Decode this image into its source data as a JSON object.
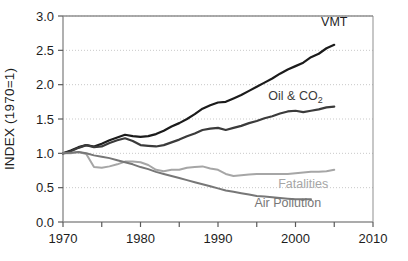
{
  "chart_data": {
    "type": "line",
    "title": "",
    "xlabel": "",
    "ylabel": "INDEX (1970=1)",
    "xlim": [
      1970,
      2010
    ],
    "ylim": [
      0.0,
      3.0
    ],
    "grid": "horizontal-dotted",
    "legend_position": "inline-right",
    "x_ticks": [
      1970,
      1975,
      1980,
      1985,
      1990,
      1995,
      2000,
      2005,
      2010
    ],
    "x_tick_labels": [
      "1970",
      "",
      "1980",
      "",
      "1990",
      "",
      "2000",
      "",
      "2010"
    ],
    "x_tick_labels_visible": [
      "1970",
      "1980",
      "1990",
      "2000",
      "2010"
    ],
    "y_ticks": [
      0.0,
      0.5,
      1.0,
      1.5,
      2.0,
      2.5,
      3.0
    ],
    "y_tick_labels": [
      "0.0",
      "0.5",
      "1.0",
      "1.5",
      "2.0",
      "2.5",
      "3.0"
    ],
    "series": [
      {
        "name": "VMT",
        "label": "VMT",
        "color": "#1b1b1b",
        "width": 2.2,
        "label_x": 2005,
        "label_y": 2.86,
        "x": [
          1970,
          1971,
          1972,
          1973,
          1974,
          1975,
          1976,
          1977,
          1978,
          1979,
          1980,
          1981,
          1982,
          1983,
          1984,
          1985,
          1986,
          1987,
          1988,
          1989,
          1990,
          1991,
          1992,
          1993,
          1994,
          1995,
          1996,
          1997,
          1998,
          1999,
          2000,
          2001,
          2002,
          2003,
          2004,
          2005
        ],
        "values": [
          1.0,
          1.04,
          1.09,
          1.12,
          1.1,
          1.14,
          1.19,
          1.23,
          1.27,
          1.25,
          1.24,
          1.25,
          1.28,
          1.33,
          1.39,
          1.44,
          1.5,
          1.57,
          1.65,
          1.7,
          1.74,
          1.75,
          1.8,
          1.85,
          1.91,
          1.97,
          2.03,
          2.09,
          2.16,
          2.22,
          2.27,
          2.32,
          2.4,
          2.45,
          2.53,
          2.58
        ]
      },
      {
        "name": "Oil & CO2",
        "label": "Oil & CO",
        "label_sub": "2",
        "color": "#3b3b3b",
        "width": 2.2,
        "label_x": 2000,
        "label_y": 1.78,
        "x": [
          1970,
          1971,
          1972,
          1973,
          1974,
          1975,
          1976,
          1977,
          1978,
          1979,
          1980,
          1981,
          1982,
          1983,
          1984,
          1985,
          1986,
          1987,
          1988,
          1989,
          1990,
          1991,
          1992,
          1993,
          1994,
          1995,
          1996,
          1997,
          1998,
          1999,
          2000,
          2001,
          2002,
          2003,
          2004,
          2005
        ],
        "values": [
          1.0,
          1.03,
          1.08,
          1.12,
          1.09,
          1.1,
          1.15,
          1.19,
          1.22,
          1.18,
          1.12,
          1.11,
          1.1,
          1.12,
          1.16,
          1.2,
          1.25,
          1.29,
          1.34,
          1.36,
          1.37,
          1.34,
          1.37,
          1.4,
          1.44,
          1.47,
          1.51,
          1.54,
          1.58,
          1.61,
          1.62,
          1.6,
          1.62,
          1.64,
          1.67,
          1.68
        ]
      },
      {
        "name": "Fatalities",
        "label": "Fatalities",
        "color": "#a6a6a6",
        "width": 2.0,
        "label_x": 2001,
        "label_y": 0.5,
        "x": [
          1970,
          1971,
          1972,
          1973,
          1974,
          1975,
          1976,
          1977,
          1978,
          1979,
          1980,
          1981,
          1982,
          1983,
          1984,
          1985,
          1986,
          1987,
          1988,
          1989,
          1990,
          1991,
          1992,
          1993,
          1994,
          1995,
          1996,
          1997,
          1998,
          1999,
          2000,
          2001,
          2002,
          2003,
          2004,
          2005
        ],
        "values": [
          1.0,
          1.0,
          1.02,
          0.99,
          0.8,
          0.79,
          0.81,
          0.84,
          0.88,
          0.88,
          0.87,
          0.83,
          0.76,
          0.74,
          0.76,
          0.76,
          0.79,
          0.8,
          0.81,
          0.78,
          0.76,
          0.7,
          0.67,
          0.68,
          0.69,
          0.7,
          0.7,
          0.7,
          0.7,
          0.7,
          0.71,
          0.72,
          0.73,
          0.73,
          0.74,
          0.76
        ]
      },
      {
        "name": "Air Pollution",
        "label": "Air Pollution",
        "color": "#777777",
        "width": 2.0,
        "label_x": 1999,
        "label_y": 0.22,
        "x": [
          1970,
          1971,
          1972,
          1973,
          1974,
          1975,
          1976,
          1977,
          1978,
          1979,
          1980,
          1981,
          1982,
          1983,
          1984,
          1985,
          1986,
          1987,
          1988,
          1989,
          1990,
          1991,
          1992,
          1993,
          1994,
          1995,
          1996,
          1997,
          1998,
          1999,
          2000,
          2001,
          2002
        ],
        "values": [
          1.0,
          1.01,
          1.02,
          1.0,
          0.97,
          0.95,
          0.93,
          0.9,
          0.87,
          0.84,
          0.8,
          0.77,
          0.73,
          0.7,
          0.67,
          0.64,
          0.61,
          0.58,
          0.55,
          0.52,
          0.49,
          0.46,
          0.44,
          0.42,
          0.4,
          0.38,
          0.37,
          0.36,
          0.35,
          0.34,
          0.33,
          0.33,
          0.33
        ]
      }
    ]
  },
  "axes": {
    "y_axis_title": "INDEX (1970=1)"
  }
}
